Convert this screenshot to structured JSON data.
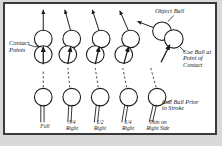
{
  "figure": {
    "border_color": "#3a3a3a",
    "background": "#ffffff",
    "page_background": "#d9d9d9",
    "ink_color": "#1a1a1a"
  },
  "annotations": {
    "contact_points": "Contact\nPoints",
    "object_ball": "Object Ball",
    "cue_ball_contact": "Cue Ball at\nPoint of\nContact",
    "cue_ball_prior": "Cue Ball Prior\nto Stroke"
  },
  "columns": [
    {
      "id": "full",
      "label": "Full",
      "fullness": "1",
      "offset_px": 0
    },
    {
      "id": "three-quarter",
      "label": "3/4\nRight",
      "fullness": "3/4",
      "offset_px": 5
    },
    {
      "id": "half",
      "label": "1/2\nRight",
      "fullness": "1/2",
      "offset_px": 10
    },
    {
      "id": "quarter",
      "label": "1/4\nRight",
      "fullness": "1/4",
      "offset_px": 15
    },
    {
      "id": "thin",
      "label": "Thin on\nRight Side",
      "fullness": "thin",
      "offset_px": 20
    }
  ],
  "elements": {
    "object_ball_name": "object-ball",
    "cue_ball_contact_name": "cue-ball-at-contact",
    "cue_ball_prior_name": "cue-ball-prior-to-stroke",
    "cue_stick_name": "cue-stick",
    "object_path_name": "object-ball-path-arrow",
    "cue_path_name": "cue-ball-path-arrow"
  }
}
